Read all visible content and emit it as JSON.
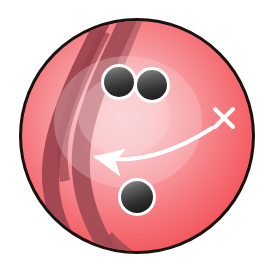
{
  "scene": {
    "title": "Bowling ball with hook-direction arrow",
    "background_color": "#ffffff",
    "width": 275,
    "height": 278
  },
  "ball": {
    "label": "bowling-ball",
    "center_x": 137,
    "center_y": 136,
    "radius": 117,
    "outline_color": "#1a1210",
    "outline_width": 3,
    "base_color": "#F4585E",
    "edge_color": "#EE4C54",
    "mid_color": "#F79095",
    "highlight_color": "#FAC8CB",
    "highlight_x": 120,
    "highlight_y": 118
  },
  "streaks": {
    "label": "marble-swirl-streaks",
    "color": "#9E4550",
    "color_soft": "#A8505A",
    "count": 4,
    "side": "left"
  },
  "holes": [
    {
      "name": "finger-hole-left",
      "cx": 119,
      "cy": 82,
      "r": 15,
      "ring_color": "#ffffff",
      "ring_width": 3,
      "fill_dark": "#2b2b2b",
      "fill_light": "#8e8e8e"
    },
    {
      "name": "finger-hole-right",
      "cx": 152,
      "cy": 85,
      "r": 15,
      "ring_color": "#ffffff",
      "ring_width": 3,
      "fill_dark": "#2b2b2b",
      "fill_light": "#8e8e8e"
    },
    {
      "name": "thumb-hole-bottom",
      "cx": 137,
      "cy": 197,
      "r": 16,
      "ring_color": "#ffffff",
      "ring_width": 3,
      "fill_dark": "#232323",
      "fill_light": "#8e8e8e"
    }
  ],
  "arrow": {
    "name": "hook-direction-arrow",
    "color": "#ffffff",
    "stroke_width": 4,
    "start_x": 212,
    "start_y": 128,
    "control_x": 150,
    "control_y": 168,
    "end_x": 96,
    "end_y": 157,
    "head_tip_x": 85,
    "head_tip_y": 157,
    "head_size": 13,
    "direction": "left"
  },
  "cross_mark": {
    "name": "x-mark",
    "symbol": "×",
    "cx": 224,
    "cy": 118,
    "size": 9,
    "color": "#ffffff",
    "stroke_width": 4
  }
}
